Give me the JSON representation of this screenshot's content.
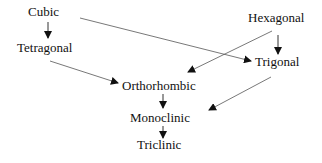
{
  "diagram": {
    "nodes": [
      {
        "id": "cubic",
        "label": "Cubic"
      },
      {
        "id": "tetragonal",
        "label": "Tetragonal"
      },
      {
        "id": "hexagonal",
        "label": "Hexagonal"
      },
      {
        "id": "trigonal",
        "label": "Trigonal"
      },
      {
        "id": "orthorhombic",
        "label": "Orthorhombic"
      },
      {
        "id": "monoclinic",
        "label": "Monoclinic"
      },
      {
        "id": "triclinic",
        "label": "Triclinic"
      }
    ],
    "edges": [
      {
        "from": "Cubic",
        "to": "Tetragonal"
      },
      {
        "from": "Cubic",
        "to": "Trigonal"
      },
      {
        "from": "Hexagonal",
        "to": "Trigonal"
      },
      {
        "from": "Hexagonal",
        "to": "Orthorhombic"
      },
      {
        "from": "Tetragonal",
        "to": "Orthorhombic"
      },
      {
        "from": "Trigonal",
        "to": "Monoclinic"
      },
      {
        "from": "Orthorhombic",
        "to": "Monoclinic"
      },
      {
        "from": "Monoclinic",
        "to": "Triclinic"
      }
    ],
    "colors": {
      "line": "#555555",
      "arrowhead": "#111111",
      "text": "#111111"
    }
  }
}
